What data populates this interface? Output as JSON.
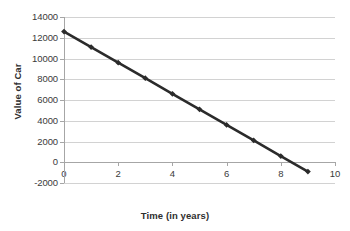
{
  "chart_data": {
    "type": "line",
    "title": "",
    "xlabel": "Time (in years)",
    "ylabel": "Value of Car",
    "x": [
      0,
      1,
      2,
      3,
      4,
      5,
      6,
      7,
      8,
      9
    ],
    "values": [
      12600,
      11100,
      9600,
      8100,
      6600,
      5100,
      3600,
      2100,
      600,
      -900
    ],
    "series": [
      {
        "name": "Value of Car",
        "values": [
          12600,
          11100,
          9600,
          8100,
          6600,
          5100,
          3600,
          2100,
          600,
          -900
        ]
      }
    ],
    "xlim": [
      0,
      10
    ],
    "ylim": [
      -2000,
      14000
    ],
    "x_ticks": [
      0,
      2,
      4,
      6,
      8,
      10
    ],
    "x_tick_labels": [
      "0",
      "2",
      "4",
      "6",
      "8",
      "10"
    ],
    "y_ticks": [
      -2000,
      0,
      2000,
      4000,
      6000,
      8000,
      10000,
      12000,
      14000
    ],
    "y_tick_labels": [
      "-2000",
      "0",
      "2000",
      "4000",
      "6000",
      "8000",
      "10000",
      "12000",
      "14000"
    ],
    "grid": true,
    "legend": false,
    "legend_position": "none",
    "line_color": "#2b2b2b",
    "grid_color": "#d2d2d2",
    "axis_color": "#a6a6a6",
    "background_color": "#ffffff",
    "marker": "diamond"
  }
}
